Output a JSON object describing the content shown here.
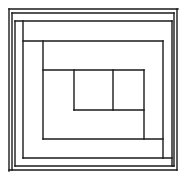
{
  "diagram": {
    "type": "log-cabin-block",
    "stroke_color": "#1a1a1a",
    "background": "#ffffff",
    "lines": [
      {
        "id": "outer-top",
        "x1": 9,
        "y1": 9,
        "x2": 178,
        "y2": 9
      },
      {
        "id": "outer-left",
        "x1": 9,
        "y1": 9,
        "x2": 9,
        "y2": 171
      },
      {
        "id": "outer-right",
        "x1": 177,
        "y1": 9,
        "x2": 177,
        "y2": 170
      },
      {
        "id": "outer-bottom",
        "x1": 9,
        "y1": 170,
        "x2": 177,
        "y2": 170
      },
      {
        "id": "frame2-top",
        "x1": 12,
        "y1": 13,
        "x2": 174,
        "y2": 13
      },
      {
        "id": "frame2-left",
        "x1": 12,
        "y1": 13,
        "x2": 12,
        "y2": 170
      },
      {
        "id": "frame2-right",
        "x1": 174,
        "y1": 13,
        "x2": 174,
        "y2": 166
      },
      {
        "id": "strip-bottom-1",
        "x1": 15,
        "y1": 166,
        "x2": 174,
        "y2": 166
      },
      {
        "id": "frame3-top",
        "x1": 15,
        "y1": 21,
        "x2": 172,
        "y2": 21
      },
      {
        "id": "frame3-left",
        "x1": 15,
        "y1": 21,
        "x2": 15,
        "y2": 166
      },
      {
        "id": "strip-right-1",
        "x1": 172,
        "y1": 21,
        "x2": 172,
        "y2": 166
      },
      {
        "id": "strip-left-1",
        "x1": 23,
        "y1": 21,
        "x2": 23,
        "y2": 158
      },
      {
        "id": "strip-bottom-2",
        "x1": 23,
        "y1": 158,
        "x2": 172,
        "y2": 158
      },
      {
        "id": "strip-top-2",
        "x1": 23,
        "y1": 41,
        "x2": 163,
        "y2": 41
      },
      {
        "id": "strip-right-2",
        "x1": 163,
        "y1": 41,
        "x2": 163,
        "y2": 158
      },
      {
        "id": "strip-left-2",
        "x1": 43,
        "y1": 41,
        "x2": 43,
        "y2": 139
      },
      {
        "id": "strip-bottom-3",
        "x1": 43,
        "y1": 139,
        "x2": 163,
        "y2": 139
      },
      {
        "id": "strip-top-3",
        "x1": 43,
        "y1": 70,
        "x2": 144,
        "y2": 70
      },
      {
        "id": "strip-right-3",
        "x1": 144,
        "y1": 70,
        "x2": 144,
        "y2": 139
      },
      {
        "id": "strip-left-3",
        "x1": 74,
        "y1": 70,
        "x2": 74,
        "y2": 110
      },
      {
        "id": "strip-bottom-4",
        "x1": 74,
        "y1": 110,
        "x2": 144,
        "y2": 110
      },
      {
        "id": "center-right",
        "x1": 113,
        "y1": 70,
        "x2": 113,
        "y2": 110
      }
    ]
  }
}
